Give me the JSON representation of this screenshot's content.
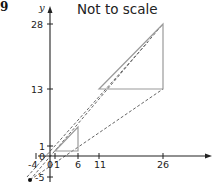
{
  "question_number": "9",
  "title": "Not to scale",
  "axes": {
    "y_label": "y",
    "x_ticks": [
      "0",
      "1",
      "6",
      "11",
      "26"
    ],
    "y_ticks": [
      "28",
      "13",
      "1",
      "0",
      "-5"
    ],
    "neg_x_label": "-4"
  },
  "shapes": {
    "small_triangle": [
      [
        1,
        1
      ],
      [
        6,
        1
      ],
      [
        6,
        6
      ]
    ],
    "large_triangle": [
      [
        11,
        13
      ],
      [
        26,
        13
      ],
      [
        26,
        28
      ]
    ],
    "centre_point": [
      -4,
      -5
    ]
  },
  "colors": {
    "axis": "#222222",
    "triangle": "#9a9a9a",
    "dashed": "#666666"
  }
}
